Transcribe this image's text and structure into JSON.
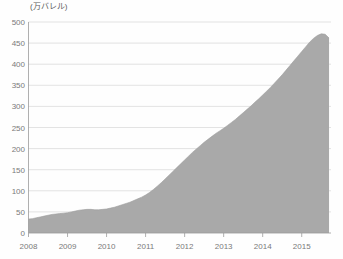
{
  "chart_data": {
    "type": "area",
    "title": "",
    "subtitle": "",
    "xlabel": "",
    "ylabel": "(万バレル)",
    "unit_label": "(万バレル)",
    "grid": true,
    "legend": "none",
    "xlim": [
      2008.0,
      2015.75
    ],
    "ylim": [
      0,
      500
    ],
    "ytick_labels": [
      "0",
      "50",
      "100",
      "150",
      "200",
      "250",
      "300",
      "350",
      "400",
      "450",
      "500"
    ],
    "ytick_values": [
      0,
      50,
      100,
      150,
      200,
      250,
      300,
      350,
      400,
      450,
      500
    ],
    "xtick_labels": [
      "2008",
      "2009",
      "2010",
      "2011",
      "2012",
      "2013",
      "2014",
      "2015"
    ],
    "xtick_values": [
      2008,
      2009,
      2010,
      2011,
      2012,
      2013,
      2014,
      2015
    ],
    "series": [
      {
        "name": "",
        "color": "#a9a9a9",
        "x": [
          2008.0,
          2008.1,
          2008.2,
          2008.3,
          2008.4,
          2008.5,
          2008.6,
          2008.7,
          2008.8,
          2008.9,
          2009.0,
          2009.1,
          2009.2,
          2009.3,
          2009.4,
          2009.5,
          2009.6,
          2009.7,
          2009.8,
          2009.9,
          2010.0,
          2010.1,
          2010.2,
          2010.3,
          2010.4,
          2010.5,
          2010.6,
          2010.7,
          2010.8,
          2010.9,
          2011.0,
          2011.1,
          2011.2,
          2011.3,
          2011.4,
          2011.5,
          2011.6,
          2011.7,
          2011.8,
          2011.9,
          2012.0,
          2012.1,
          2012.2,
          2012.3,
          2012.4,
          2012.5,
          2012.6,
          2012.7,
          2012.8,
          2012.9,
          2013.0,
          2013.1,
          2013.2,
          2013.3,
          2013.4,
          2013.5,
          2013.6,
          2013.7,
          2013.8,
          2013.9,
          2014.0,
          2014.1,
          2014.2,
          2014.3,
          2014.4,
          2014.5,
          2014.6,
          2014.7,
          2014.8,
          2014.9,
          2015.0,
          2015.1,
          2015.2,
          2015.3,
          2015.4,
          2015.5,
          2015.6,
          2015.7
        ],
        "values": [
          33,
          34,
          36,
          38,
          40,
          42,
          44,
          45,
          46,
          47,
          48,
          50,
          52,
          54,
          55,
          56,
          56,
          55,
          55,
          56,
          57,
          59,
          61,
          64,
          67,
          70,
          73,
          77,
          81,
          85,
          90,
          96,
          103,
          111,
          119,
          128,
          137,
          146,
          155,
          164,
          173,
          182,
          191,
          199,
          207,
          215,
          222,
          229,
          236,
          242,
          248,
          255,
          262,
          269,
          277,
          285,
          293,
          301,
          310,
          318,
          327,
          336,
          345,
          355,
          365,
          375,
          386,
          397,
          408,
          419,
          430,
          441,
          452,
          461,
          468,
          472,
          471,
          462
        ]
      }
    ]
  }
}
